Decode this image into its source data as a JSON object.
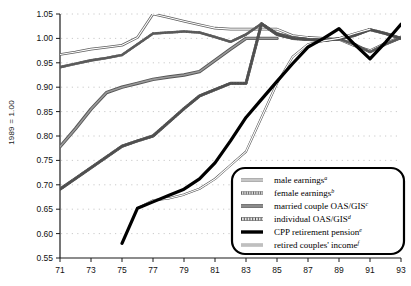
{
  "chart_data": {
    "type": "line",
    "title": "",
    "subtitle": "",
    "xlabel": "",
    "ylabel": "1989 = 1.00",
    "xlim": [
      71,
      93
    ],
    "ylim": [
      0.55,
      1.05
    ],
    "xticks": [
      71,
      73,
      75,
      77,
      79,
      81,
      83,
      85,
      87,
      89,
      91,
      93
    ],
    "xtick_labels": [
      "71",
      "73",
      "75",
      "77",
      "79",
      "81",
      "83",
      "85",
      "87",
      "89",
      "91",
      "93"
    ],
    "yticks": [
      0.55,
      0.6,
      0.65,
      0.7,
      0.75,
      0.8,
      0.85,
      0.9,
      0.95,
      1.0,
      1.05
    ],
    "ytick_labels": [
      "0.55",
      "0.60",
      "0.65",
      "0.70",
      "0.75",
      "0.80",
      "0.85",
      "0.90",
      "0.95",
      "1.00",
      "1.05"
    ],
    "grid": "horizontal-dotted",
    "legend_position": "bottom-right",
    "series": [
      {
        "name": "male earnings",
        "superscript": "a",
        "style": "double-thin-gray",
        "x": [
          71,
          72,
          73,
          74,
          75,
          76,
          77,
          78,
          79,
          80,
          81,
          82,
          83,
          84,
          85,
          86,
          87,
          88,
          89,
          90,
          91,
          92,
          93
        ],
        "values": [
          0.967,
          0.972,
          0.978,
          0.982,
          0.986,
          1.002,
          1.05,
          1.043,
          1.035,
          1.028,
          1.021,
          1.019,
          1.019,
          1.019,
          1.019,
          1.006,
          1.002,
          1.0,
          0.998,
          0.985,
          0.975,
          0.99,
          1.003
        ]
      },
      {
        "name": "female earnings",
        "superscript": "b",
        "style": "hatched-thin-gray",
        "x": [
          71,
          72,
          73,
          74,
          75,
          76,
          77,
          78,
          79,
          80,
          81,
          82,
          83,
          84,
          85,
          86,
          87,
          88,
          89,
          90,
          91,
          92,
          93
        ],
        "values": [
          0.941,
          0.948,
          0.955,
          0.96,
          0.966,
          0.988,
          1.01,
          1.012,
          1.014,
          1.012,
          1.003,
          0.993,
          1.008,
          1.03,
          1.01,
          1.002,
          0.998,
          0.996,
          0.999,
          0.988,
          0.972,
          0.988,
          1.001
        ]
      },
      {
        "name": "married couple OAS/GIS",
        "superscript": "c",
        "style": "thick-gray",
        "x": [
          71,
          72,
          73,
          74,
          75,
          76,
          77,
          78,
          79,
          80,
          81,
          82,
          83,
          84,
          85
        ],
        "values": [
          0.778,
          0.815,
          0.855,
          0.889,
          0.9,
          0.908,
          0.916,
          0.921,
          0.925,
          0.932,
          0.955,
          0.978,
          1.0,
          1.0,
          1.0
        ]
      },
      {
        "name": "individual OAS/GIS",
        "superscript": "d",
        "style": "hatched-medium-gray",
        "x": [
          71,
          72,
          73,
          74,
          75,
          76,
          77,
          78,
          79,
          80,
          81,
          82,
          83,
          84,
          85,
          86,
          87,
          88,
          89,
          90,
          91,
          92,
          93
        ],
        "values": [
          0.691,
          0.713,
          0.735,
          0.757,
          0.779,
          0.79,
          0.8,
          0.828,
          0.856,
          0.882,
          0.895,
          0.908,
          0.908,
          1.03,
          1.008,
          1.0,
          0.998,
          0.996,
          0.999,
          1.006,
          1.018,
          1.01,
          1.0
        ]
      },
      {
        "name": "CPP retirement pension",
        "superscript": "e",
        "style": "thick-black",
        "x": [
          75,
          76,
          77,
          78,
          79,
          80,
          81,
          82,
          83,
          84,
          85,
          86,
          87,
          88,
          89,
          90,
          91,
          92,
          93
        ],
        "values": [
          0.58,
          0.652,
          0.665,
          0.678,
          0.691,
          0.712,
          0.745,
          0.79,
          0.838,
          0.875,
          0.912,
          0.948,
          0.982,
          1.0,
          1.02,
          0.988,
          0.958,
          0.992,
          1.029
        ]
      },
      {
        "name": "retired couples' income",
        "superscript": "f",
        "style": "double-thin-outline",
        "x": [
          76,
          77,
          78,
          79,
          80,
          81,
          82,
          83,
          84,
          85,
          86,
          87,
          88,
          89,
          90,
          91
        ],
        "values": [
          0.652,
          0.668,
          0.672,
          0.68,
          0.692,
          0.712,
          0.74,
          0.768,
          0.838,
          0.908,
          0.962,
          0.988,
          0.995,
          1.0,
          1.01,
          1.019
        ]
      }
    ]
  },
  "legend": {
    "items": [
      {
        "label": "male earnings",
        "superscript": "a",
        "swatch": "double-thin-gray"
      },
      {
        "label": "female earnings",
        "superscript": "b",
        "swatch": "hatched-thin-gray"
      },
      {
        "label": "married couple OAS/GIS",
        "superscript": "c",
        "swatch": "thick-gray"
      },
      {
        "label": "individual OAS/GIS",
        "superscript": "d",
        "swatch": "hatched-medium-gray"
      },
      {
        "label": "CPP retirement pension",
        "superscript": "e",
        "swatch": "thick-black"
      },
      {
        "label": "retired couples' income",
        "superscript": "f",
        "swatch": "double-thin-outline"
      }
    ]
  },
  "colors": {
    "axis": "#1a1a1a",
    "grid": "#bdbdbd",
    "gray_line": "#6b6b6b",
    "black_line": "#000000",
    "background": "#ffffff"
  }
}
